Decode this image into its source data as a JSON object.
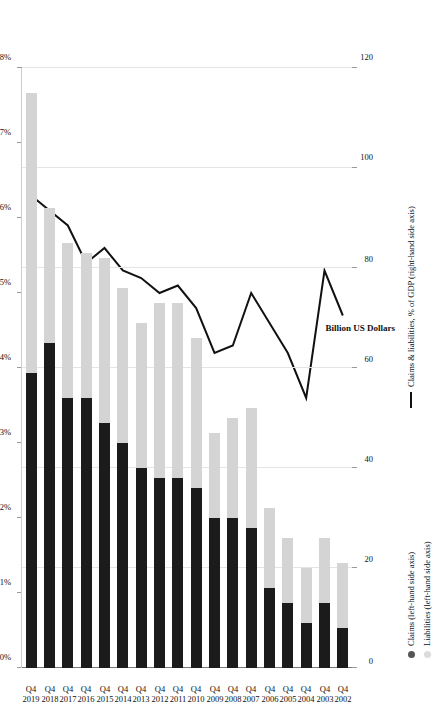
{
  "chart_data": {
    "type": "bar",
    "title": "",
    "subtitle": "",
    "orientation": "horizontal-rotated",
    "stacked": true,
    "categories": [
      "Q4 2002",
      "Q4 2003",
      "Q4 2004",
      "Q4 2005",
      "Q4 2006",
      "Q4 2007",
      "Q4 2008",
      "Q4 2009",
      "Q4 2010",
      "Q4 2011",
      "Q4 2012",
      "Q4 2013",
      "Q4 2014",
      "Q4 2015",
      "Q4 2016",
      "Q4 2017",
      "Q4 2018",
      "Q4 2019"
    ],
    "category_quarter": "Q4",
    "category_years": [
      "2002",
      "2003",
      "2004",
      "2005",
      "2006",
      "2007",
      "2008",
      "2009",
      "2010",
      "2011",
      "2012",
      "2013",
      "2014",
      "2015",
      "2016",
      "2017",
      "2018",
      "2019"
    ],
    "series": [
      {
        "name": "Claims (left-hand side axis)",
        "short_name": "Claims",
        "axis": "left",
        "type": "bar",
        "color": "#1b1b1b",
        "values": [
          8,
          13,
          9,
          13,
          16,
          28,
          30,
          30,
          36,
          38,
          38,
          40,
          45,
          49,
          54,
          54,
          65,
          59
        ]
      },
      {
        "name": "Liabilities (left-hand side axis)",
        "short_name": "Liabilities",
        "axis": "left",
        "type": "bar",
        "color": "#d4d4d4",
        "values": [
          13,
          13,
          11,
          13,
          16,
          24,
          20,
          17,
          30,
          35,
          35,
          29,
          31,
          33,
          29,
          31,
          27,
          56
        ]
      },
      {
        "name": "Claims & liabilities, % of GDP (right-hand side axis)",
        "short_name": "Claims & liabilities, % of GDP",
        "axis": "right",
        "type": "line",
        "color": "#111111",
        "values": [
          4.7,
          5.3,
          3.6,
          4.2,
          4.6,
          5.0,
          4.3,
          4.2,
          4.8,
          5.1,
          5.0,
          5.2,
          5.3,
          5.6,
          5.4,
          5.9,
          6.1,
          6.3
        ]
      }
    ],
    "left_axis": {
      "label": "Billion US Dollars",
      "ticks": [
        "0",
        "20",
        "40",
        "60",
        "80",
        "100",
        "120"
      ],
      "min": 0,
      "max": 120,
      "step": 20
    },
    "right_axis": {
      "label": "",
      "ticks": [
        "0%",
        "1%",
        "2%",
        "3%",
        "4%",
        "5%",
        "6%",
        "7%",
        "8%"
      ],
      "min": 0,
      "max": 8,
      "step": 1,
      "unit": "%"
    },
    "grid": true,
    "legend_position": "right",
    "legend": [
      {
        "marker": "dot",
        "marker_color": "#555555",
        "label": "Claims (left-hand side axis)"
      },
      {
        "marker": "dot",
        "marker_color": "#dcdcdc",
        "label": "Liabilities (left-hand side axis)"
      },
      {
        "marker": "line",
        "marker_color": "#111111",
        "label": "Claims & liabilities, % of GDP (right-hand side axis)"
      }
    ]
  }
}
